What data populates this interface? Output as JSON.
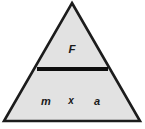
{
  "figure": {
    "name": "Formula triangle for force, mass and acceleration",
    "type": "formula-triangle",
    "numerator": "F",
    "denominator_left": "m",
    "denominator_operator": "x",
    "denominator_right": "a",
    "relationship": "F = m x a",
    "colors": {
      "background": "#ffffff",
      "triangle_fill": "#e2e2e2",
      "triangle_outline": "#1c1c1c",
      "divider": "#0d0d0d",
      "label_text": "#1a1a1a"
    },
    "geometry": {
      "apex": [
        72,
        3
      ],
      "base_left": [
        4,
        121
      ],
      "base_right": [
        140,
        121
      ],
      "divider_y": 69,
      "divider_x_start": 37,
      "divider_x_end": 108,
      "divider_thickness": 4
    }
  }
}
